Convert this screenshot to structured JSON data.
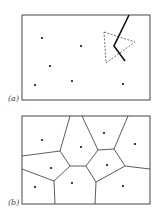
{
  "panels": [
    {
      "id": "a",
      "label": "(a)",
      "frame": {
        "x": 22,
        "y": 15,
        "w": 128,
        "h": 85
      },
      "points": [
        [
          42,
          38
        ],
        [
          81,
          46
        ],
        [
          50,
          66
        ],
        [
          72,
          81
        ],
        [
          35,
          85
        ],
        [
          123,
          84
        ]
      ],
      "dashed_triangle": [
        [
          104,
          32
        ],
        [
          135,
          42
        ],
        [
          106,
          63
        ]
      ],
      "bisector_polyline": [
        [
          129,
          15
        ],
        [
          114,
          46
        ],
        [
          125,
          61
        ]
      ]
    },
    {
      "id": "b",
      "label": "(b)",
      "frame": {
        "x": 22,
        "y": 116,
        "w": 128,
        "h": 88
      },
      "points": [
        [
          42,
          140
        ],
        [
          81,
          147
        ],
        [
          104,
          133
        ],
        [
          135,
          144
        ],
        [
          51,
          168
        ],
        [
          107,
          165
        ],
        [
          35,
          187
        ],
        [
          72,
          183
        ],
        [
          123,
          186
        ]
      ],
      "voronoi_edges": [
        [
          [
            22,
            156
          ],
          [
            60,
            151
          ]
        ],
        [
          [
            60,
            151
          ],
          [
            70,
            116
          ]
        ],
        [
          [
            60,
            151
          ],
          [
            70,
            166
          ]
        ],
        [
          [
            70,
            166
          ],
          [
            86,
            166
          ]
        ],
        [
          [
            86,
            166
          ],
          [
            98,
            150
          ]
        ],
        [
          [
            98,
            150
          ],
          [
            82,
            116
          ]
        ],
        [
          [
            98,
            150
          ],
          [
            114,
            149
          ]
        ],
        [
          [
            114,
            149
          ],
          [
            128,
            116
          ]
        ],
        [
          [
            114,
            149
          ],
          [
            125,
            166
          ]
        ],
        [
          [
            125,
            166
          ],
          [
            150,
            169
          ]
        ],
        [
          [
            125,
            166
          ],
          [
            96,
            182
          ]
        ],
        [
          [
            96,
            182
          ],
          [
            86,
            166
          ]
        ],
        [
          [
            96,
            182
          ],
          [
            95,
            204
          ]
        ],
        [
          [
            70,
            166
          ],
          [
            54,
            181
          ]
        ],
        [
          [
            54,
            181
          ],
          [
            55,
            204
          ]
        ],
        [
          [
            54,
            181
          ],
          [
            22,
            169
          ]
        ]
      ]
    }
  ]
}
